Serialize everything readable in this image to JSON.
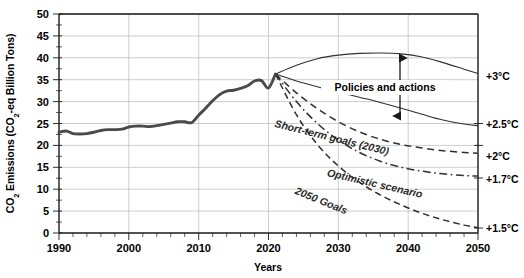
{
  "chart_data": {
    "type": "line",
    "title": "",
    "xlabel": "Years",
    "ylabel": "CO₂ Emissions (CO₂-eq Billion Tons)",
    "xlim": [
      1990,
      2050
    ],
    "ylim": [
      0,
      50
    ],
    "grid": true,
    "legend_position": "inline-curve-labels",
    "xticks": [
      1990,
      2000,
      2010,
      2020,
      2030,
      2040,
      2050
    ],
    "xtick_labels": [
      "1990",
      "2000",
      "2010",
      "2020",
      "2030",
      "2040",
      "2050"
    ],
    "x_minor_tick_interval": 2,
    "yticks": [
      0,
      5,
      10,
      15,
      20,
      25,
      30,
      35,
      40,
      45,
      50
    ],
    "ytick_labels": [
      "0",
      "5",
      "10",
      "15",
      "20",
      "25",
      "30",
      "35",
      "40",
      "45",
      "50"
    ],
    "series": [
      {
        "name": "Historical emissions",
        "style": "solid-thick",
        "color": "#4a4a4a",
        "x": [
          1990,
          1991,
          1992,
          1993,
          1994,
          1995,
          1996,
          1997,
          1998,
          1999,
          2000,
          2001,
          2002,
          2003,
          2004,
          2005,
          2006,
          2007,
          2008,
          2009,
          2010,
          2011,
          2012,
          2013,
          2014,
          2015,
          2016,
          2017,
          2018,
          2019,
          2020,
          2021
        ],
        "values": [
          23.0,
          23.3,
          22.7,
          22.6,
          22.7,
          23.0,
          23.4,
          23.6,
          23.6,
          23.7,
          24.2,
          24.4,
          24.4,
          24.3,
          24.5,
          24.8,
          25.1,
          25.4,
          25.4,
          25.2,
          26.9,
          28.5,
          30.2,
          31.6,
          32.4,
          32.6,
          33.0,
          33.6,
          34.7,
          34.8,
          33.1,
          36.3
        ]
      },
      {
        "name": "Policies and actions upper bound",
        "style": "solid-thin",
        "color": "#303030",
        "x": [
          2021,
          2024,
          2027,
          2030,
          2033,
          2036,
          2039,
          2042,
          2045,
          2048,
          2050
        ],
        "values": [
          36.3,
          38.3,
          39.8,
          40.6,
          41.0,
          41.1,
          40.9,
          40.2,
          38.9,
          37.4,
          36.4
        ]
      },
      {
        "name": "Policies and actions lower bound",
        "style": "solid-thin",
        "color": "#303030",
        "x": [
          2021,
          2024,
          2027,
          2030,
          2033,
          2036,
          2039,
          2042,
          2045,
          2048,
          2050
        ],
        "values": [
          36.3,
          34.7,
          33.4,
          32.2,
          31.0,
          29.8,
          28.5,
          27.1,
          25.8,
          24.9,
          24.5
        ]
      },
      {
        "name": "Short-term goals (2030)",
        "style": "dashed-long",
        "color": "#303030",
        "x": [
          2021,
          2024,
          2027,
          2030,
          2033,
          2036,
          2039,
          2042,
          2045,
          2048,
          2050
        ],
        "values": [
          36.3,
          32.0,
          28.4,
          25.4,
          23.1,
          21.4,
          20.2,
          19.4,
          18.8,
          18.4,
          18.2
        ]
      },
      {
        "name": "Optimistic scenario",
        "style": "dash-dot",
        "color": "#303030",
        "x": [
          2021,
          2024,
          2027,
          2030,
          2033,
          2036,
          2039,
          2042,
          2045,
          2048,
          2050
        ],
        "values": [
          36.3,
          30.0,
          25.0,
          21.2,
          18.4,
          16.4,
          15.0,
          14.1,
          13.5,
          13.1,
          13.0
        ]
      },
      {
        "name": "2050 Goals",
        "style": "dashed-short",
        "color": "#303030",
        "x": [
          2021,
          2024,
          2027,
          2030,
          2033,
          2036,
          2039,
          2042,
          2045,
          2048,
          2050
        ],
        "values": [
          36.3,
          27.0,
          20.2,
          15.3,
          11.6,
          8.7,
          6.4,
          4.5,
          3.0,
          1.8,
          1.2
        ]
      }
    ],
    "right_axis_labels": [
      {
        "label": "+3°C",
        "value": 36.4
      },
      {
        "label": "+2.5°C",
        "value": 24.5
      },
      {
        "label": "+2°C",
        "value": 18.2
      },
      {
        "label": "+1.7°C",
        "value": 13.0
      },
      {
        "label": "+1.5°C",
        "value": 1.2
      }
    ],
    "annotations": [
      {
        "name": "policies-and-actions",
        "text": "Policies and actions",
        "kind": "double-arrow-label",
        "x": 2038,
        "y_top": 41.0,
        "y_bottom": 26.8
      },
      {
        "name": "short-term-goals",
        "text": "Short-term goals (2030)",
        "kind": "curve-label"
      },
      {
        "name": "optimistic-scenario",
        "text": "Optimistic scenario",
        "kind": "curve-label"
      },
      {
        "name": "goals-2050",
        "text": "2050 Goals",
        "kind": "curve-label"
      }
    ]
  }
}
